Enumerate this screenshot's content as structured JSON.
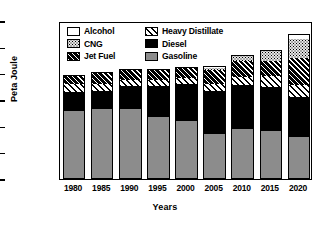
{
  "chart_data": {
    "type": "bar",
    "subtype": "stacked-vertical",
    "title": "",
    "xlabel": "Years",
    "ylabel": "Peta Joule",
    "categories": [
      "1980",
      "1985",
      "1990",
      "1995",
      "2000",
      "2005",
      "2010",
      "2015",
      "2020"
    ],
    "ylim": [
      0,
      30000
    ],
    "yticks": [
      0,
      5000,
      10000,
      15000,
      20000,
      25000,
      30000
    ],
    "ytick_labels": [
      "0",
      "5000",
      "10000",
      "15000",
      "20000",
      "25000",
      "30000"
    ],
    "grid": false,
    "legend_position": "top-left-inside",
    "series": [
      {
        "name": "Gasoline",
        "values": [
          12900,
          13200,
          13200,
          11800,
          11000,
          8600,
          9500,
          9100,
          7900
        ]
      },
      {
        "name": "Diesel",
        "values": [
          3600,
          3500,
          4400,
          5800,
          7100,
          8100,
          8400,
          8400,
          7600
        ]
      },
      {
        "name": "Heavy Distillate",
        "values": [
          1500,
          1300,
          1200,
          1200,
          1100,
          1300,
          1500,
          2000,
          2300
        ]
      },
      {
        "name": "Jet Fuel",
        "values": [
          1800,
          2400,
          2100,
          2100,
          2000,
          2700,
          3000,
          3000,
          5200
        ]
      },
      {
        "name": "CNG",
        "values": [
          0,
          0,
          0,
          0,
          0,
          400,
          1000,
          1800,
          3500
        ]
      },
      {
        "name": "Alcohol",
        "values": [
          0,
          0,
          0,
          0,
          0,
          400,
          100,
          100,
          1000
        ]
      }
    ],
    "totals": [
      19800,
      20400,
      20900,
      20900,
      21200,
      21500,
      23500,
      24400,
      27500
    ],
    "legend_entries": [
      {
        "label": "Alcohol",
        "pattern": "solid-white",
        "color": "#ffffff"
      },
      {
        "label": "Heavy Distillate",
        "pattern": "light-hatch",
        "color": "#ffffff"
      },
      {
        "label": "CNG",
        "pattern": "dotted",
        "color": "#e6e6e6"
      },
      {
        "label": "Diesel",
        "pattern": "solid-black",
        "color": "#000000"
      },
      {
        "label": "Jet Fuel",
        "pattern": "dark-hatch",
        "color": "#000000"
      },
      {
        "label": "Gasoline",
        "pattern": "solid-gray",
        "color": "#8c8c8c"
      }
    ]
  }
}
